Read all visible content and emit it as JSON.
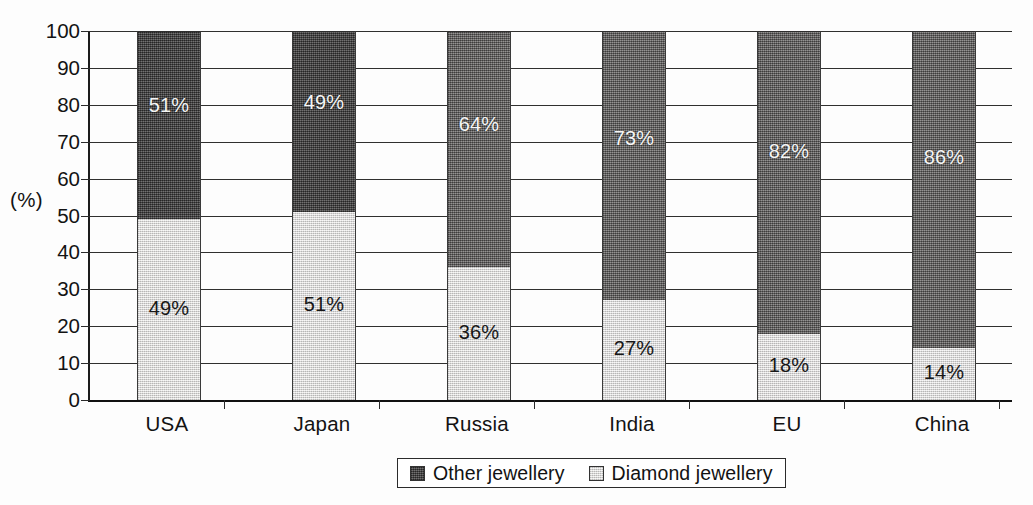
{
  "chart_data": {
    "type": "bar",
    "subtype": "100% stacked column",
    "title": "",
    "xlabel": "",
    "ylabel": "(%)",
    "ylim": [
      0,
      100
    ],
    "yticks": [
      0,
      10,
      20,
      30,
      40,
      50,
      60,
      70,
      80,
      90,
      100
    ],
    "ytick_labels": [
      "0",
      "10",
      "20",
      "30",
      "40",
      "50",
      "60",
      "70",
      "80",
      "90",
      "100"
    ],
    "grid": true,
    "legend_position": "bottom-center",
    "categories": [
      "USA",
      "Japan",
      "Russia",
      "India",
      "EU",
      "China"
    ],
    "series": [
      {
        "name": "Other jewellery",
        "color": "#4d4c4c",
        "values": [
          51,
          49,
          64,
          73,
          82,
          86
        ],
        "data_labels": [
          "51%",
          "49%",
          "64%",
          "73%",
          "82%",
          "86%"
        ]
      },
      {
        "name": "Diamond jewellery",
        "color": "#e2e1e0",
        "values": [
          49,
          51,
          36,
          27,
          18,
          14
        ],
        "data_labels": [
          "49%",
          "51%",
          "36%",
          "27%",
          "18%",
          "14%"
        ]
      }
    ]
  },
  "legend": {
    "items": [
      {
        "label": "Other jewellery",
        "swatch": "dark"
      },
      {
        "label": "Diamond jewellery",
        "swatch": "light"
      }
    ]
  },
  "axis": {
    "y_title": "(%)"
  }
}
